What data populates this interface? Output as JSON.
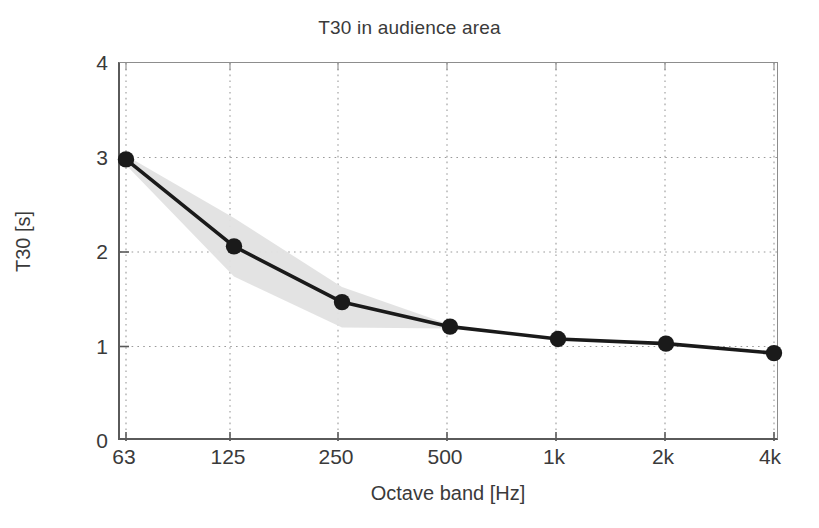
{
  "chart_data": {
    "type": "line",
    "title": "T30 in audience area",
    "xlabel": "Octave band [Hz]",
    "ylabel": "T30 [s]",
    "categories": [
      "63",
      "125",
      "250",
      "500",
      "1k",
      "2k",
      "4k"
    ],
    "x_tick_labels": [
      "63",
      "125",
      "250",
      "500",
      "1k",
      "2k",
      "4k"
    ],
    "y_tick_labels": [
      "0",
      "1",
      "2",
      "3",
      "4"
    ],
    "y_tick_values": [
      0,
      1,
      2,
      3,
      4
    ],
    "ylim": [
      0,
      4
    ],
    "xlim": [
      0,
      6
    ],
    "grid": "dotted",
    "legend": "none",
    "series": [
      {
        "name": "T30 mean",
        "marker": "filled-circle",
        "color": "#1a1a1a",
        "values": [
          2.98,
          2.06,
          1.47,
          1.21,
          1.08,
          1.03,
          0.93
        ]
      }
    ],
    "band": {
      "name": "spread",
      "color": "#e2e2e2",
      "upper": [
        3.02,
        2.36,
        1.63,
        1.23,
        null,
        null,
        null
      ],
      "lower": [
        2.92,
        1.74,
        1.2,
        1.19,
        null,
        null,
        null
      ],
      "x_extent": [
        "63",
        "500"
      ]
    },
    "annotations": []
  },
  "axes": {
    "title": "T30 in audience area",
    "xlabel": "Octave band [Hz]",
    "ylabel": "T30 [s]"
  },
  "style": {
    "axis_color": "#5a5a5a",
    "grid_color": "#9a9a9a",
    "line_color": "#1a1a1a",
    "band_color": "#e2e2e2",
    "background": "#ffffff"
  }
}
